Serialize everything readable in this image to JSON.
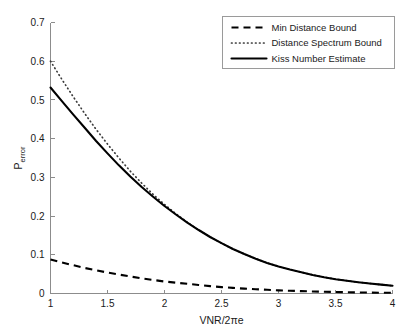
{
  "chart_data": {
    "type": "line",
    "title": "",
    "xlabel": "VNR/2πe",
    "ylabel_base": "P",
    "ylabel_sub": "error",
    "ylabel": "P_error",
    "xlim": [
      1,
      4
    ],
    "ylim": [
      0,
      0.7
    ],
    "xticks": [
      1,
      1.5,
      2,
      2.5,
      3,
      3.5,
      4
    ],
    "xtick_labels": [
      "1",
      "1.5",
      "2",
      "2.5",
      "3",
      "3.5",
      "4"
    ],
    "yticks": [
      0,
      0.1,
      0.2,
      0.3,
      0.4,
      0.5,
      0.6,
      0.7
    ],
    "ytick_labels": [
      "0",
      "0.1",
      "0.2",
      "0.3",
      "0.4",
      "0.5",
      "0.6",
      "0.7"
    ],
    "grid": false,
    "legend_position": "upper right",
    "x": [
      1.0,
      1.1,
      1.2,
      1.3,
      1.4,
      1.5,
      1.6,
      1.7,
      1.8,
      1.9,
      2.0,
      2.1,
      2.2,
      2.3,
      2.4,
      2.5,
      2.6,
      2.7,
      2.8,
      2.9,
      3.0,
      3.1,
      3.2,
      3.3,
      3.4,
      3.5,
      3.6,
      3.7,
      3.8,
      3.9,
      4.0
    ],
    "series": [
      {
        "name": "Min Distance Bound",
        "style": "dashed",
        "color": "#000000",
        "values": [
          0.088,
          0.08,
          0.073,
          0.066,
          0.06,
          0.054,
          0.049,
          0.044,
          0.039,
          0.035,
          0.031,
          0.028,
          0.025,
          0.022,
          0.019,
          0.0165,
          0.0145,
          0.0126,
          0.011,
          0.0095,
          0.0082,
          0.0071,
          0.0061,
          0.0053,
          0.0045,
          0.0038,
          0.0033,
          0.0028,
          0.0024,
          0.002,
          0.0017
        ]
      },
      {
        "name": "Distance Spectrum Bound",
        "style": "dotted",
        "color": "#3a3a3a",
        "values": [
          0.6,
          0.553,
          0.508,
          0.465,
          0.424,
          0.386,
          0.35,
          0.316,
          0.285,
          0.256,
          0.23,
          0.206,
          0.184,
          0.164,
          0.146,
          0.13,
          0.115,
          0.102,
          0.09,
          0.079,
          0.07,
          0.062,
          0.055,
          0.048,
          0.042,
          0.037,
          0.033,
          0.029,
          0.026,
          0.023,
          0.02
        ]
      },
      {
        "name": "Kiss Number Estimate",
        "style": "solid",
        "color": "#000000",
        "values": [
          0.532,
          0.497,
          0.462,
          0.428,
          0.394,
          0.362,
          0.331,
          0.302,
          0.275,
          0.25,
          0.226,
          0.204,
          0.183,
          0.164,
          0.146,
          0.13,
          0.115,
          0.102,
          0.09,
          0.079,
          0.07,
          0.062,
          0.055,
          0.048,
          0.042,
          0.037,
          0.033,
          0.029,
          0.026,
          0.023,
          0.02
        ]
      }
    ]
  },
  "legend": {
    "items": [
      {
        "label": "Min Distance Bound",
        "style": "dashed"
      },
      {
        "label": "Distance Spectrum Bound",
        "style": "dotted"
      },
      {
        "label": "Kiss Number Estimate",
        "style": "solid"
      }
    ]
  },
  "colors": {
    "background": "#ffffff",
    "axis": "#8c8c8c",
    "text": "#1a1a1a",
    "legend_border": "#9a9a9a"
  }
}
